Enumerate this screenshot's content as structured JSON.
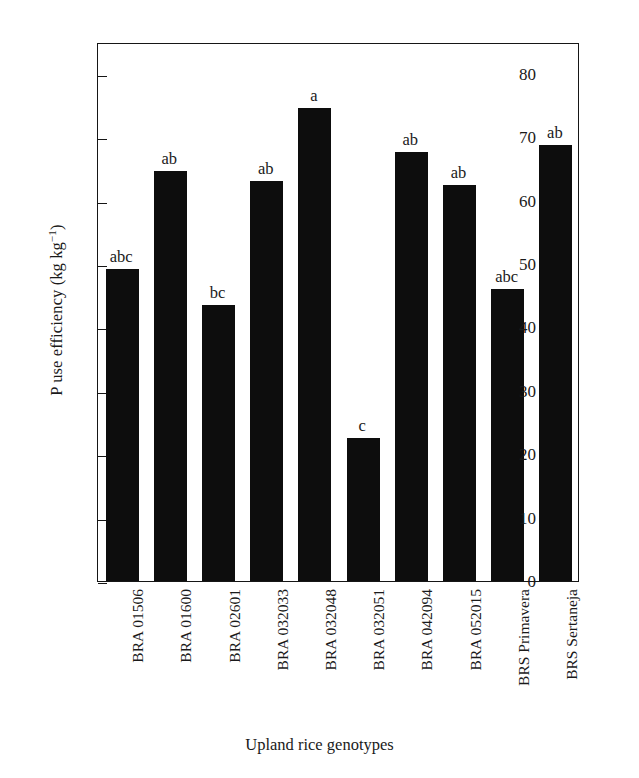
{
  "chart_data": {
    "type": "bar",
    "title": "",
    "xlabel": "Upland rice genotypes",
    "ylabel": "P use efficiency (kg kg",
    "ylabel_sup": "−1",
    "ylabel_tail": ")",
    "ylabel_full": "P use efficiency (kg kg⁻¹)",
    "categories": [
      "BRA 01506",
      "BRA 01600",
      "BRA 02601",
      "BRA 032033",
      "BRA 032048",
      "BRA 032051",
      "BRA 042094",
      "BRA 052015",
      "BRS Primavera",
      "BRS Sertaneja"
    ],
    "values": [
      49.2,
      64.7,
      43.6,
      63.1,
      74.6,
      22.6,
      67.7,
      62.5,
      46.1,
      68.7
    ],
    "annotations": [
      "abc",
      "ab",
      "bc",
      "ab",
      "a",
      "c",
      "ab",
      "ab",
      "abc",
      "ab"
    ],
    "yticks": [
      0,
      10,
      20,
      30,
      40,
      50,
      60,
      70,
      80
    ],
    "ytick_labels": [
      "0",
      "10",
      "20",
      "30",
      "40",
      "50",
      "60",
      "70",
      "80"
    ],
    "ylim": [
      0,
      85
    ],
    "xlim_slots": 10,
    "grid": false,
    "legend": null,
    "bar_color": "#0d0d0d",
    "frame_color": "#161616",
    "background": "#ffffff"
  }
}
